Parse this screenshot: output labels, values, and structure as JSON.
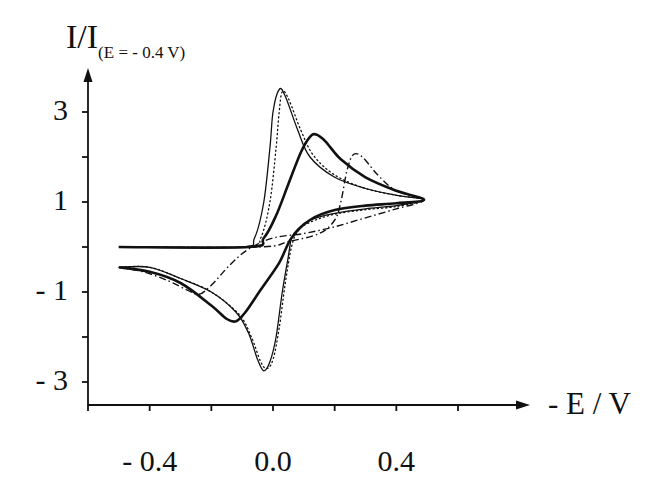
{
  "chart_data": {
    "type": "line",
    "title": "",
    "xlabel": "- E / V",
    "ylabel": "I/I",
    "ylabel_subscript": "(E = - 0.4 V)",
    "xlim": [
      -0.6,
      0.6
    ],
    "ylim": [
      -3.5,
      4
    ],
    "x_ticks": [
      -0.6,
      -0.4,
      -0.2,
      0.0,
      0.2,
      0.4,
      0.6
    ],
    "x_tick_labels": [
      {
        "value": -0.4,
        "label": "- 0.4"
      },
      {
        "value": 0.0,
        "label": "0.0"
      },
      {
        "value": 0.4,
        "label": "0.4"
      }
    ],
    "y_ticks": [
      3,
      2,
      1,
      0,
      -1,
      -2,
      -3
    ],
    "y_tick_labels": [
      {
        "value": 3,
        "label": "3"
      },
      {
        "value": 1,
        "label": "1"
      },
      {
        "value": -1,
        "label": "- 1"
      },
      {
        "value": -3,
        "label": "- 3"
      }
    ],
    "grid": false,
    "legend": null,
    "series": [
      {
        "name": "thin-solid",
        "style": "solid",
        "width": 1.3,
        "points": [
          [
            -0.4,
            0.0
          ],
          [
            -0.1,
            0.0
          ],
          [
            -0.06,
            0.2
          ],
          [
            -0.03,
            1.0
          ],
          [
            -0.01,
            2.2
          ],
          [
            0.0,
            3.0
          ],
          [
            0.02,
            3.5
          ],
          [
            0.04,
            3.35
          ],
          [
            0.08,
            2.6
          ],
          [
            0.12,
            2.0
          ],
          [
            0.2,
            1.55
          ],
          [
            0.3,
            1.3
          ],
          [
            0.4,
            1.15
          ],
          [
            0.49,
            1.05
          ],
          [
            0.4,
            0.92
          ],
          [
            0.3,
            0.85
          ],
          [
            0.2,
            0.75
          ],
          [
            0.12,
            0.6
          ],
          [
            0.08,
            0.4
          ],
          [
            0.06,
            0.2
          ],
          [
            0.05,
            -0.2
          ],
          [
            0.03,
            -1.0
          ],
          [
            0.01,
            -2.0
          ],
          [
            -0.01,
            -2.55
          ],
          [
            -0.03,
            -2.75
          ],
          [
            -0.05,
            -2.5
          ],
          [
            -0.08,
            -1.9
          ],
          [
            -0.12,
            -1.45
          ],
          [
            -0.2,
            -1.0
          ],
          [
            -0.3,
            -0.7
          ],
          [
            -0.4,
            -0.45
          ],
          [
            -0.5,
            -0.45
          ]
        ]
      },
      {
        "name": "dotted",
        "style": "dotted",
        "width": 1.3,
        "points": [
          [
            -0.4,
            0.0
          ],
          [
            -0.08,
            0.0
          ],
          [
            -0.04,
            0.2
          ],
          [
            -0.01,
            1.0
          ],
          [
            0.01,
            2.2
          ],
          [
            0.02,
            3.0
          ],
          [
            0.03,
            3.45
          ],
          [
            0.05,
            3.3
          ],
          [
            0.09,
            2.6
          ],
          [
            0.13,
            2.05
          ],
          [
            0.2,
            1.6
          ],
          [
            0.3,
            1.3
          ],
          [
            0.4,
            1.15
          ],
          [
            0.49,
            1.05
          ],
          [
            0.4,
            0.9
          ],
          [
            0.3,
            0.83
          ],
          [
            0.2,
            0.73
          ],
          [
            0.12,
            0.55
          ],
          [
            0.08,
            0.35
          ],
          [
            0.06,
            0.0
          ],
          [
            0.04,
            -0.8
          ],
          [
            0.02,
            -1.8
          ],
          [
            0.0,
            -2.5
          ],
          [
            -0.02,
            -2.7
          ],
          [
            -0.04,
            -2.55
          ],
          [
            -0.07,
            -2.0
          ],
          [
            -0.11,
            -1.5
          ],
          [
            -0.2,
            -1.0
          ],
          [
            -0.3,
            -0.7
          ],
          [
            -0.4,
            -0.45
          ],
          [
            -0.5,
            -0.45
          ]
        ]
      },
      {
        "name": "thick-solid",
        "style": "solid",
        "width": 2.6,
        "points": [
          [
            -0.5,
            0.0
          ],
          [
            -0.08,
            0.0
          ],
          [
            -0.03,
            0.2
          ],
          [
            0.01,
            0.7
          ],
          [
            0.05,
            1.4
          ],
          [
            0.09,
            2.1
          ],
          [
            0.12,
            2.45
          ],
          [
            0.14,
            2.5
          ],
          [
            0.17,
            2.35
          ],
          [
            0.22,
            1.95
          ],
          [
            0.3,
            1.55
          ],
          [
            0.4,
            1.25
          ],
          [
            0.49,
            1.05
          ],
          [
            0.4,
            0.97
          ],
          [
            0.3,
            0.92
          ],
          [
            0.2,
            0.82
          ],
          [
            0.12,
            0.6
          ],
          [
            0.06,
            0.2
          ],
          [
            0.02,
            -0.35
          ],
          [
            -0.04,
            -0.95
          ],
          [
            -0.09,
            -1.45
          ],
          [
            -0.12,
            -1.65
          ],
          [
            -0.15,
            -1.6
          ],
          [
            -0.2,
            -1.3
          ],
          [
            -0.3,
            -0.8
          ],
          [
            -0.4,
            -0.55
          ],
          [
            -0.5,
            -0.45
          ]
        ]
      },
      {
        "name": "dash-dot",
        "style": "dashdot",
        "width": 1.4,
        "points": [
          [
            -0.5,
            0.0
          ],
          [
            -0.05,
            0.0
          ],
          [
            0.05,
            0.12
          ],
          [
            0.15,
            0.3
          ],
          [
            0.2,
            0.6
          ],
          [
            0.22,
            1.0
          ],
          [
            0.24,
            1.7
          ],
          [
            0.26,
            2.05
          ],
          [
            0.29,
            2.0
          ],
          [
            0.34,
            1.6
          ],
          [
            0.4,
            1.25
          ],
          [
            0.49,
            1.05
          ],
          [
            0.4,
            0.85
          ],
          [
            0.3,
            0.65
          ],
          [
            0.2,
            0.45
          ],
          [
            0.1,
            0.3
          ],
          [
            0.0,
            0.2
          ],
          [
            -0.08,
            -0.05
          ],
          [
            -0.14,
            -0.4
          ],
          [
            -0.2,
            -0.85
          ],
          [
            -0.24,
            -1.05
          ],
          [
            -0.28,
            -0.95
          ],
          [
            -0.34,
            -0.75
          ],
          [
            -0.42,
            -0.55
          ],
          [
            -0.5,
            -0.45
          ]
        ]
      }
    ]
  }
}
